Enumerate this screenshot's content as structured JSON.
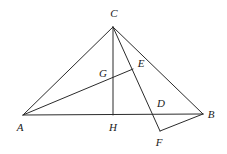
{
  "figure": {
    "type": "geometry-diagram",
    "canvas": {
      "width": 227,
      "height": 154
    },
    "stroke_color": "#2b2b2b",
    "background_color": "#ffffff",
    "stroke_width": 1
  },
  "points": {
    "A": {
      "label": "A",
      "x": 23,
      "y": 115,
      "label_x": 20,
      "label_y": 127
    },
    "B": {
      "label": "B",
      "x": 203,
      "y": 114,
      "label_x": 211,
      "label_y": 114
    },
    "C": {
      "label": "C",
      "x": 113,
      "y": 27,
      "label_x": 114,
      "label_y": 13
    },
    "D": {
      "label": "D",
      "x": 157,
      "y": 114,
      "label_x": 161,
      "label_y": 103
    },
    "E": {
      "label": "E",
      "x": 133,
      "y": 69,
      "label_x": 141,
      "label_y": 63
    },
    "F": {
      "label": "F",
      "x": 160,
      "y": 131,
      "label_x": 159,
      "label_y": 142
    },
    "G": {
      "label": "G",
      "x": 113,
      "y": 76,
      "label_x": 103,
      "label_y": 73
    },
    "H": {
      "label": "H",
      "x": 113,
      "y": 115,
      "label_x": 113,
      "label_y": 127
    }
  },
  "segments": [
    {
      "name": "side-AB",
      "from": "A",
      "to": "B"
    },
    {
      "name": "side-AC",
      "from": "A",
      "to": "C"
    },
    {
      "name": "side-CB",
      "from": "C",
      "to": "B"
    },
    {
      "name": "altitude-CH",
      "from": "C",
      "to": "H"
    },
    {
      "name": "cevian-CF",
      "from": "C",
      "to": "F"
    },
    {
      "name": "cevian-AE",
      "from": "A",
      "to": "E"
    },
    {
      "name": "segment-FB",
      "from": "F",
      "to": "B"
    }
  ],
  "labels_order": [
    "C",
    "E",
    "G",
    "A",
    "H",
    "D",
    "B",
    "F"
  ]
}
